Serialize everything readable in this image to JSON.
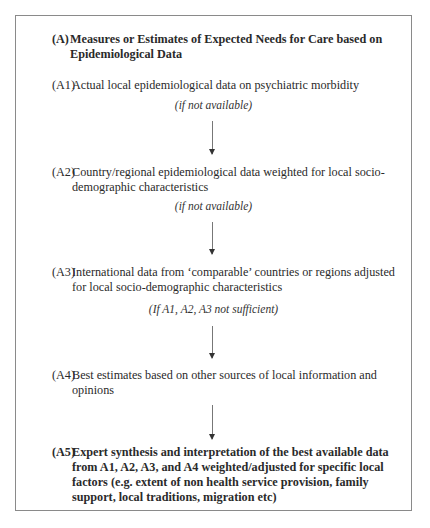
{
  "header_clipped": "Exploring the Psychiatric Morbidity ...",
  "diagram": {
    "title_label": "(A)",
    "title": "Measures or Estimates of Expected Needs for Care based on Epidemiological Data",
    "steps": [
      {
        "id": "(A1)",
        "text": "Actual local epidemiological data on psychiatric morbidity"
      },
      {
        "id": "(A2)",
        "text": "Country/regional epidemiological data weighted for local socio-demographic characteristics"
      },
      {
        "id": "(A3)",
        "text": "International data from ‘comparable’ countries or regions adjusted for local socio-demographic characteristics"
      },
      {
        "id": "(A4)",
        "text": "Best estimates based on other sources of local information and opinions"
      },
      {
        "id": "(A5)",
        "text": "Expert synthesis and interpretation of the best available data from A1, A2, A3, and A4 weighted/adjusted for specific local factors (e.g. extent of non health service provision, family support, local traditions, migration etc)"
      }
    ],
    "conditions": [
      "(if not available)",
      "(if not available)",
      "(If A1, A2, A3 not sufficient)"
    ]
  }
}
